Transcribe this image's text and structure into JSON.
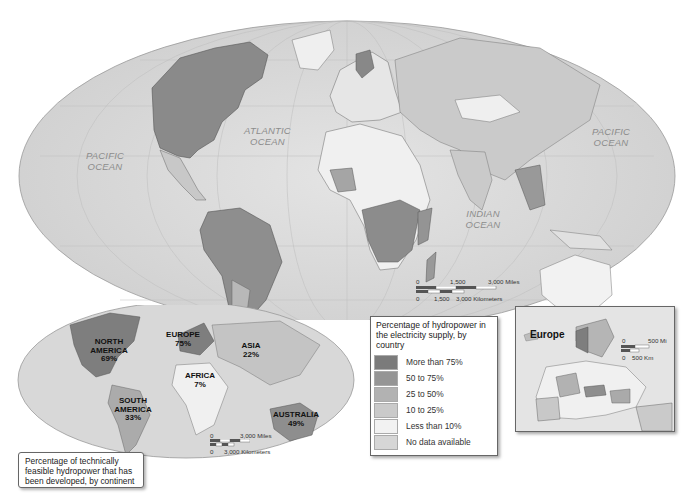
{
  "main_map": {
    "oceans": [
      {
        "name": "pacific-west",
        "line1": "PACIFIC",
        "line2": "OCEAN"
      },
      {
        "name": "atlantic",
        "line1": "ATLANTIC",
        "line2": "OCEAN"
      },
      {
        "name": "indian",
        "line1": "INDIAN",
        "line2": "OCEAN"
      },
      {
        "name": "pacific-east",
        "line1": "PACIFIC",
        "line2": "OCEAN"
      }
    ],
    "scale": {
      "miles_0": "0",
      "miles_mid": "1,500",
      "miles_end": "3,000 Miles",
      "km_0": "0",
      "km_mid": "1,500",
      "km_end": "3,000 Kilometers"
    }
  },
  "legend": {
    "title": "Percentage of hydropower in the electricity supply, by country",
    "items": [
      {
        "label": "More than 75%",
        "color": "#7b7b7b"
      },
      {
        "label": "50 to 75%",
        "color": "#959595"
      },
      {
        "label": "25 to 50%",
        "color": "#b2b2b2"
      },
      {
        "label": "10 to 25%",
        "color": "#cacaca"
      },
      {
        "label": "Less than 10%",
        "color": "#f2f2f2"
      },
      {
        "label": "No data available",
        "color": "#d6d6d6"
      }
    ]
  },
  "continent_map": {
    "caption": "Percentage of technically feasible hydropower that has been developed, by continent",
    "continents": [
      {
        "name": "NORTH AMERICA",
        "line1": "NORTH",
        "line2": "AMERICA",
        "value": "69%"
      },
      {
        "name": "EUROPE",
        "line1": "EUROPE",
        "value": "75%"
      },
      {
        "name": "ASIA",
        "line1": "ASIA",
        "value": "22%"
      },
      {
        "name": "AFRICA",
        "line1": "AFRICA",
        "value": "7%"
      },
      {
        "name": "SOUTH AMERICA",
        "line1": "SOUTH",
        "line2": "AMERICA",
        "value": "33%"
      },
      {
        "name": "AUSTRALIA",
        "line1": "AUSTRALIA",
        "value": "49%"
      }
    ],
    "scale": {
      "miles_0": "0",
      "miles_end": "3,000 Miles",
      "km_0": "0",
      "km_end": "3,000 Kilometers"
    }
  },
  "europe_inset": {
    "title": "Europe",
    "scale": {
      "mi_0": "0",
      "mi_end": "500 Mi",
      "km_0": "0",
      "km_end": "500 Km"
    }
  }
}
